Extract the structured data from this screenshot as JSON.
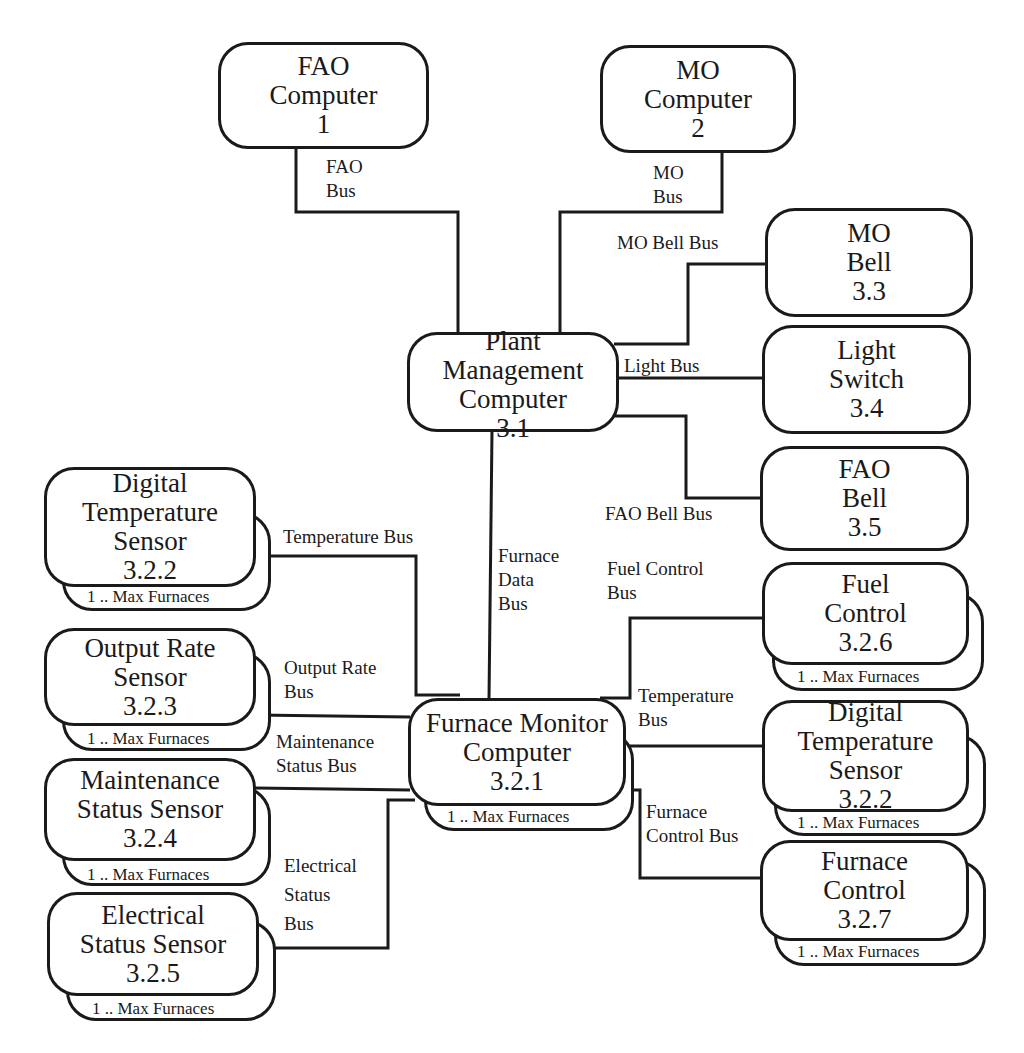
{
  "diagram": {
    "type": "system-architecture",
    "nodes": {
      "fao_computer": {
        "lines": [
          "FAO",
          "Computer",
          "1"
        ]
      },
      "mo_computer": {
        "lines": [
          "MO",
          "Computer",
          "2"
        ]
      },
      "mo_bell": {
        "lines": [
          "MO",
          "Bell",
          "3.3"
        ]
      },
      "plant_mgmt": {
        "lines": [
          "Plant",
          "Management",
          "Computer",
          "3.1"
        ]
      },
      "light_switch": {
        "lines": [
          "Light",
          "Switch",
          "3.4"
        ]
      },
      "fao_bell": {
        "lines": [
          "FAO",
          "Bell",
          "3.5"
        ]
      },
      "fuel_control": {
        "lines": [
          "Fuel",
          "Control",
          "3.2.6"
        ],
        "multiplicity": "1 .. Max Furnaces"
      },
      "furnace_monitor": {
        "lines": [
          "Furnace Monitor",
          "Computer",
          "3.2.1"
        ],
        "multiplicity": "1 .. Max Furnaces"
      },
      "digital_temp_right": {
        "lines": [
          "Digital",
          "Temperature",
          "Sensor",
          "3.2.2"
        ],
        "multiplicity": "1 .. Max Furnaces"
      },
      "furnace_control": {
        "lines": [
          "Furnace",
          "Control",
          "3.2.7"
        ],
        "multiplicity": "1 .. Max Furnaces"
      },
      "digital_temp_left": {
        "lines": [
          "Digital",
          "Temperature",
          "Sensor",
          "3.2.2"
        ],
        "multiplicity": "1 .. Max Furnaces"
      },
      "output_rate": {
        "lines": [
          "Output Rate",
          "Sensor",
          "3.2.3"
        ],
        "multiplicity": "1 .. Max Furnaces"
      },
      "maintenance": {
        "lines": [
          "Maintenance",
          "Status Sensor",
          "3.2.4"
        ],
        "multiplicity": "1 .. Max Furnaces"
      },
      "electrical": {
        "lines": [
          "Electrical",
          "Status Sensor",
          "3.2.5"
        ],
        "multiplicity": "1 .. Max Furnaces"
      }
    },
    "buses": {
      "fao_bus": [
        "FAO",
        "Bus"
      ],
      "mo_bus": [
        "MO",
        "Bus"
      ],
      "mo_bell_bus": [
        "MO Bell Bus"
      ],
      "light_bus": [
        "Light Bus"
      ],
      "fao_bell_bus": [
        "FAO Bell Bus"
      ],
      "furnace_data_bus": [
        "Furnace",
        "Data",
        "Bus"
      ],
      "fuel_control_bus": [
        "Fuel Control",
        "Bus"
      ],
      "temperature_bus_left": [
        "Temperature Bus"
      ],
      "output_rate_bus": [
        "Output Rate",
        "Bus"
      ],
      "maintenance_status_bus": [
        "Maintenance",
        "Status Bus"
      ],
      "electrical_status_bus": [
        "Electrical",
        "Status",
        "Bus"
      ],
      "temperature_bus_right": [
        "Temperature",
        "Bus"
      ],
      "furnace_control_bus": [
        "Furnace",
        "Control Bus"
      ]
    }
  }
}
